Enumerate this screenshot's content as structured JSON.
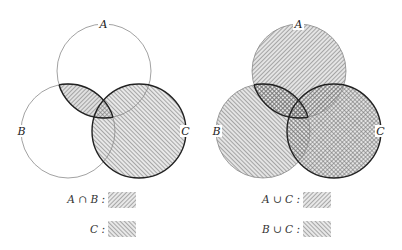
{
  "left_diagram": {
    "labels": {
      "a": "A",
      "b": "B",
      "c": "C"
    },
    "legend": [
      {
        "label": "A ∩ B :",
        "pattern": "north-east-hatch"
      },
      {
        "label": "C :",
        "pattern": "north-west-hatch"
      }
    ]
  },
  "right_diagram": {
    "labels": {
      "a": "A",
      "b": "B",
      "c": "C"
    },
    "legend": [
      {
        "label": "A ∪ C :",
        "pattern": "north-east-hatch"
      },
      {
        "label": "B ∪ C :",
        "pattern": "north-west-hatch"
      }
    ]
  },
  "colors": {
    "stroke": "#222222",
    "thin_stroke": "#8a8a8a",
    "hatch": "#6a6a6a"
  }
}
